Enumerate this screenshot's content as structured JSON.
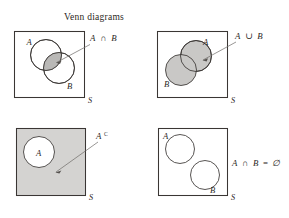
{
  "figure": {
    "title": "Venn diagrams",
    "background_color": "#ffffff",
    "line_color": "#3a3634",
    "shade_color": "#d4d3d1",
    "circle_shade_color": "#c9c8c6",
    "lens_shade_color": "#b9b8b6"
  },
  "panels": [
    {
      "id": "intersection",
      "expression": "A ∩ B",
      "expression_parts": {
        "left": "A",
        "op": "∩",
        "right": "B"
      },
      "universe_label": "S",
      "circle_a_label": "A",
      "circle_b_label": "B",
      "shaded_region": "intersection",
      "universe_shaded": false,
      "leader": "arrow from expression to shaded lens"
    },
    {
      "id": "union",
      "expression": "A ∪ B",
      "expression_parts": {
        "left": "A",
        "op": "∪",
        "right": "B"
      },
      "universe_label": "S",
      "circle_a_label": "A",
      "circle_b_label": "B",
      "shaded_region": "union",
      "universe_shaded": false,
      "leader": "arrow from expression to shaded circles"
    },
    {
      "id": "complement",
      "expression": "A",
      "expression_superscript": "C",
      "universe_label": "S",
      "circle_a_label": "A",
      "shaded_region": "complement-of-A",
      "universe_shaded": true,
      "leader": "arrow from expression to shaded universe"
    },
    {
      "id": "disjoint",
      "expression": "A ∩ B = ∅",
      "expression_parts": {
        "left": "A",
        "op": "∩",
        "right": "B",
        "eq": "=",
        "empty": "∅"
      },
      "universe_label": "S",
      "circle_a_label": "A",
      "circle_b_label": "B",
      "shaded_region": "none",
      "universe_shaded": false,
      "leader": "none"
    }
  ]
}
